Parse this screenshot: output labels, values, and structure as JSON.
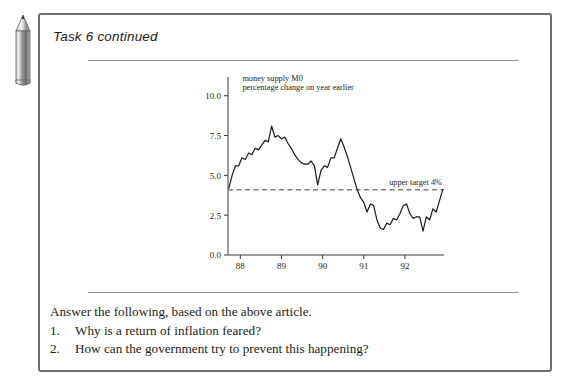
{
  "page": {
    "background": "#ffffff",
    "panel_border_color": "#6e6e6e"
  },
  "decoration": {
    "pencil_icon": "pencil-icon"
  },
  "header": {
    "title": "Task 6 continued"
  },
  "chart_data": {
    "type": "line",
    "title": "money supply M0",
    "subtitle": "percentage change on year earlier",
    "xlabel": "",
    "ylabel": "",
    "ylim": [
      0.0,
      10.8
    ],
    "xlim": [
      87.7,
      92.95
    ],
    "yticks": [
      "0.0",
      "2.5",
      "5.0",
      "7.5",
      "10.0"
    ],
    "ytick_values": [
      0.0,
      2.5,
      5.0,
      7.5,
      10.0
    ],
    "xticks": [
      "88",
      "89",
      "90",
      "91",
      "92"
    ],
    "xtick_values": [
      88,
      89,
      90,
      91,
      92
    ],
    "grid": false,
    "legend": "none",
    "annotations": [
      {
        "label": "upper target 4%",
        "value": 4.1,
        "style": "dashed-horizontal-line"
      }
    ],
    "series": [
      {
        "name": "money supply M0 percentage change on year earlier",
        "color": "#1a1a1a",
        "x": [
          87.72,
          87.8,
          87.88,
          87.96,
          88.04,
          88.12,
          88.2,
          88.28,
          88.36,
          88.44,
          88.52,
          88.6,
          88.68,
          88.76,
          88.84,
          88.92,
          89.0,
          89.08,
          89.16,
          89.24,
          89.32,
          89.4,
          89.48,
          89.56,
          89.64,
          89.72,
          89.8,
          89.88,
          89.96,
          90.04,
          90.12,
          90.2,
          90.28,
          90.36,
          90.44,
          90.52,
          90.6,
          90.68,
          90.76,
          90.84,
          90.92,
          91.0,
          91.08,
          91.16,
          91.24,
          91.32,
          91.4,
          91.48,
          91.56,
          91.64,
          91.72,
          91.8,
          91.88,
          91.96,
          92.04,
          92.12,
          92.2,
          92.28,
          92.36,
          92.44,
          92.52,
          92.6,
          92.68,
          92.76,
          92.84,
          92.92
        ],
        "values": [
          4.2,
          5.0,
          5.6,
          5.6,
          6.1,
          6.0,
          6.4,
          6.3,
          6.7,
          6.6,
          6.9,
          7.2,
          7.1,
          8.1,
          7.4,
          7.5,
          7.3,
          7.4,
          7.0,
          6.7,
          6.3,
          6.0,
          5.8,
          5.7,
          5.7,
          5.9,
          5.6,
          4.4,
          5.3,
          5.6,
          5.5,
          6.1,
          6.1,
          6.7,
          7.3,
          6.8,
          6.2,
          5.5,
          4.8,
          4.1,
          3.6,
          3.3,
          2.7,
          3.2,
          3.1,
          2.2,
          1.7,
          1.6,
          2.0,
          1.9,
          2.3,
          2.2,
          2.6,
          3.1,
          3.2,
          2.6,
          2.3,
          2.4,
          2.4,
          1.5,
          2.4,
          2.2,
          2.9,
          2.7,
          3.4,
          4.1
        ]
      }
    ]
  },
  "questions": {
    "lead": "Answer the following, based on the above article.",
    "items": [
      {
        "number": "1.",
        "text": "Why is a return of inflation feared?"
      },
      {
        "number": "2.",
        "text": "How can the government try to prevent this happening?"
      }
    ]
  }
}
